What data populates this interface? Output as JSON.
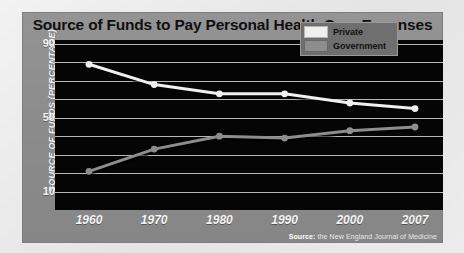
{
  "chart_data": {
    "type": "line",
    "title": "Source of Funds to Pay Personal Health Care Expenses",
    "xlabel": "",
    "ylabel": "SOURCE OF FUNDS (PERCENTAGE)",
    "categories": [
      "1960",
      "1970",
      "1980",
      "1990",
      "2000",
      "2007"
    ],
    "x": [
      1960,
      1970,
      1980,
      1990,
      2000,
      2007
    ],
    "series": [
      {
        "name": "Private",
        "color": "#f0f0ee",
        "values": [
          79,
          68,
          63,
          63,
          58,
          55
        ]
      },
      {
        "name": "Government",
        "color": "#8d8d8d",
        "values": [
          21,
          33,
          40,
          39,
          43,
          45
        ]
      }
    ],
    "ylim": [
      0,
      90
    ],
    "yticks": [
      90,
      50,
      10
    ],
    "ytick_labels": [
      "90",
      "50",
      "10"
    ],
    "gridline_values": [
      90,
      80,
      70,
      60,
      50,
      40,
      30,
      20,
      10
    ],
    "grid": true,
    "legend_position": "top-right",
    "source": "the New England Journal of Medicine",
    "source_prefix": "Source:"
  },
  "legend": {
    "items": [
      {
        "label": "Private",
        "color": "#f0f0ee"
      },
      {
        "label": "Government",
        "color": "#8d8d8d"
      }
    ]
  },
  "colors": {
    "card_background": "#8e8e8e",
    "plot_background": "#050505",
    "gridline": "#d8d8d8",
    "title_text": "#101010",
    "axis_text": "#f4f4f4",
    "private": "#f0f0ee",
    "government": "#8d8d8d"
  }
}
